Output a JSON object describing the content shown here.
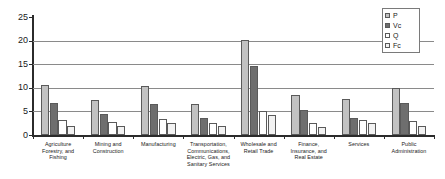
{
  "chart_data": {
    "type": "bar",
    "title": "",
    "subtitle": "",
    "xlabel": "",
    "ylabel": "",
    "ylim": [
      0,
      25
    ],
    "yticks": [
      0,
      5,
      10,
      15,
      20,
      25
    ],
    "ytick_labels": [
      "0",
      "5",
      "10",
      "15",
      "20",
      "25"
    ],
    "grid": true,
    "grid_axis": "y",
    "legend_position": "top-right",
    "bar_layout": "grouped",
    "categories": [
      "Agriculture Forestry, and Fishing",
      "Mining and Construction",
      "Manufacturing",
      "Transportation, Communications, Electric, Gas, and Sanitary Services",
      "Wholesale and Retail Trade",
      "Finance, Insurance, and Real Estate",
      "Services",
      "Public Administration"
    ],
    "category_lines": [
      [
        "Agriculture",
        "Forestry, and",
        "Fishing"
      ],
      [
        "Mining and",
        "Construction"
      ],
      [
        "Manufacturing"
      ],
      [
        "Transportation,",
        "Communications,",
        "Electric, Gas, and",
        "Sanitary Services"
      ],
      [
        "Wholesale and",
        "Retail Trade"
      ],
      [
        "Finance,",
        "Insurance, and",
        "Real Estate"
      ],
      [
        "Services"
      ],
      [
        "Public",
        "Administration"
      ]
    ],
    "series": [
      {
        "name": "P",
        "color": "#c2c2c2",
        "values": [
          10.5,
          7.5,
          10.4,
          6.6,
          20.2,
          8.4,
          7.7,
          9.9
        ]
      },
      {
        "name": "Vc",
        "color": "#6e6e6e",
        "values": [
          6.8,
          4.4,
          6.6,
          3.7,
          14.6,
          5.3,
          3.5,
          6.7
        ]
      },
      {
        "name": "Q",
        "color": "#ffffff",
        "values": [
          3.2,
          2.8,
          3.4,
          2.5,
          5.1,
          2.6,
          3.2,
          2.9
        ]
      },
      {
        "name": "Fc",
        "color": "#f2f2f2",
        "values": [
          2.0,
          2.0,
          2.6,
          2.0,
          4.2,
          1.8,
          2.6,
          2.0
        ]
      }
    ],
    "legend": [
      {
        "label": "P",
        "color": "#c2c2c2"
      },
      {
        "label": "Vc",
        "color": "#6e6e6e"
      },
      {
        "label": "Q",
        "color": "#ffffff"
      },
      {
        "label": "Fc",
        "color": "#f2f2f2"
      }
    ]
  },
  "axis_colors": {
    "axis_line": "#2b2b2b",
    "gridline": "#8a8a8a",
    "bar_border": "#5a5a5a",
    "text": "#1a1a1a",
    "background": "#ffffff"
  }
}
